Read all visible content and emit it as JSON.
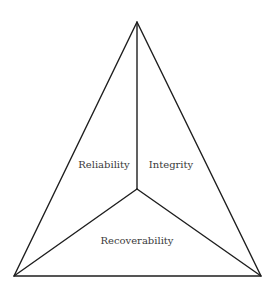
{
  "diagram": {
    "type": "triangle-partition",
    "labels": {
      "reliability": "Reliability",
      "integrity": "Integrity",
      "recoverability": "Recoverability"
    },
    "vertices": {
      "apex": [
        137,
        22
      ],
      "bottom_left": [
        14,
        276
      ],
      "bottom_right": [
        261,
        276
      ],
      "center": [
        137,
        189
      ]
    },
    "colors": {
      "line": "#1e1e1e",
      "text": "#3a3a3a",
      "background": "#ffffff"
    }
  }
}
